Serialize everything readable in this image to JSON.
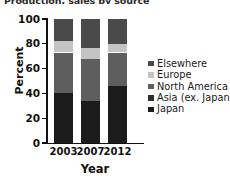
{
  "title": {
    "text": "Production, sales by source"
  },
  "chart_data": {
    "type": "bar",
    "subtype": "stacked-bar-100",
    "title": "Production, sales by source",
    "xlabel": "Year",
    "ylabel": "Percent",
    "categories": [
      "2003",
      "2007",
      "2012"
    ],
    "ylim": [
      0,
      100
    ],
    "yticks": [
      "0",
      "20",
      "40",
      "60",
      "80",
      "100"
    ],
    "grid": false,
    "legend_position": "right",
    "units": "percent",
    "series": [
      {
        "name": "Japan",
        "color": "#1b1b1b",
        "values": [
          40,
          34,
          46
        ]
      },
      {
        "name": "Asia (ex. Japan)",
        "color": "#2e2e2e",
        "values": [
          0,
          0,
          0
        ]
      },
      {
        "name": "North America",
        "color": "#5e5e5e",
        "values": [
          33,
          34,
          27
        ]
      },
      {
        "name": "Europe",
        "color": "#c4c4c4",
        "values": [
          9,
          9,
          7
        ]
      },
      {
        "name": "Elsewhere",
        "color": "#4a4a4a",
        "values": [
          18,
          23,
          20
        ]
      }
    ],
    "stack_order_bottom_to_top": [
      "Japan",
      "Asia (ex. Japan)",
      "North America",
      "Europe",
      "Elsewhere"
    ]
  },
  "legend": {
    "items": [
      {
        "label": "Elsewhere",
        "color": "#4a4a4a"
      },
      {
        "label": "Europe",
        "color": "#c4c4c4"
      },
      {
        "label": "North America",
        "color": "#5e5e5e"
      },
      {
        "label": "Asia (ex. Japan)",
        "color": "#2e2e2e"
      },
      {
        "label": "Japan",
        "color": "#1b1b1b"
      }
    ]
  },
  "colors": {
    "background": "#ffffff",
    "axis": "#111111",
    "text": "#111111"
  }
}
